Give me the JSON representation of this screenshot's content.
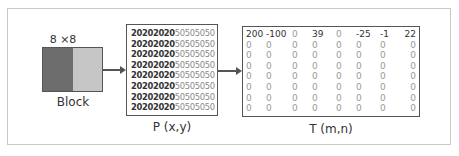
{
  "diagram": {
    "block": {
      "size_label": "8 ×8",
      "label": "Block",
      "colors": {
        "dark": "#6d6d6d",
        "light": "#c6c6c6"
      }
    },
    "p_matrix": {
      "label": "P (x,y)",
      "rows": [
        {
          "left": "20202020",
          "right": "50505050"
        },
        {
          "left": "20202020",
          "right": "50505050"
        },
        {
          "left": "20202020",
          "right": "50505050"
        },
        {
          "left": "20202020",
          "right": "50505050"
        },
        {
          "left": "20202020",
          "right": "50505050"
        },
        {
          "left": "20202020",
          "right": "50505050"
        },
        {
          "left": "20202020",
          "right": "50505050"
        },
        {
          "left": "20202020",
          "right": "50505050"
        }
      ]
    },
    "t_matrix": {
      "label": "T (m,n)",
      "rows": [
        [
          "200",
          "-100",
          "0",
          "39",
          "0",
          "-25",
          "-1",
          "22"
        ],
        [
          "0",
          "0",
          "0",
          "0",
          "0",
          "0",
          "0",
          "0"
        ],
        [
          "0",
          "0",
          "0",
          "0",
          "0",
          "0",
          "0",
          "0"
        ],
        [
          "0",
          "0",
          "0",
          "0",
          "0",
          "0",
          "0",
          "0"
        ],
        [
          "0",
          "0",
          "0",
          "0",
          "0",
          "0",
          "0",
          "0"
        ],
        [
          "0",
          "0",
          "0",
          "0",
          "0",
          "0",
          "0",
          "0"
        ],
        [
          "0",
          "0",
          "0",
          "0",
          "0",
          "0",
          "0",
          "0"
        ],
        [
          "0",
          "0",
          "0",
          "0",
          "0",
          "0",
          "0",
          "0"
        ]
      ]
    }
  }
}
